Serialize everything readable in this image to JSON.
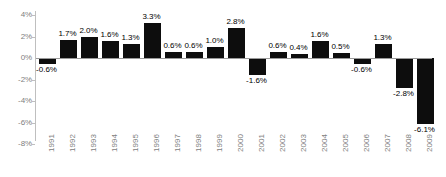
{
  "chart_data": {
    "type": "bar",
    "title": "",
    "subtitle": "",
    "xlabel": "",
    "ylabel": "",
    "ylim": [
      -8,
      4
    ],
    "ytick_values": [
      4,
      2,
      0,
      -2,
      -4,
      -6,
      -8
    ],
    "ytick_labels": [
      "4%",
      "2%",
      "0%",
      "-2%",
      "-4%",
      "-6%",
      "-8%"
    ],
    "grid": false,
    "legend": false,
    "legend_position": "none",
    "bar_color": "#0d0d0d",
    "axis_color": "#bfbfbf",
    "label_color": "#808080",
    "data_label_color": "#000000",
    "xtick_rotation": 90,
    "categories": [
      "1991",
      "1992",
      "1993",
      "1994",
      "1995",
      "1996",
      "1997",
      "1998",
      "1999",
      "2000",
      "2001",
      "2002",
      "2003",
      "2004",
      "2005",
      "2006",
      "2007",
      "2008",
      "2009"
    ],
    "values": [
      -0.6,
      1.7,
      2.0,
      1.6,
      1.3,
      3.3,
      0.6,
      0.6,
      1.0,
      2.8,
      -1.6,
      0.6,
      0.4,
      1.6,
      0.5,
      -0.6,
      1.3,
      -2.8,
      -6.1
    ],
    "data_labels": [
      "-0.6%",
      "1.7%",
      "2.0%",
      "1.6%",
      "1.3%",
      "3.3%",
      "0.6%",
      "0.6%",
      "1.0%",
      "2.8%",
      "-1.6%",
      "0.6%",
      "0.4%",
      "1.6%",
      "0.5%",
      "-0.6%",
      "1.3%",
      "-2.8%",
      "-6.1%"
    ]
  }
}
